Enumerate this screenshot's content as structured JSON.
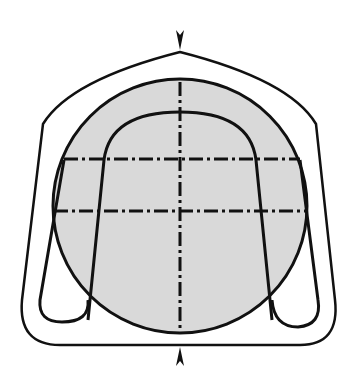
{
  "diagram": {
    "colors": {
      "stroke": "#111111",
      "fill": "#d9d9d9",
      "background": "#ffffff"
    },
    "elements": [
      "outer-frame",
      "circle-section",
      "u-loop",
      "left-loop-foot",
      "right-loop-foot",
      "horizontal-centerline-upper",
      "horizontal-centerline-lower",
      "vertical-centerline",
      "top-arrow",
      "bottom-arrow"
    ]
  }
}
